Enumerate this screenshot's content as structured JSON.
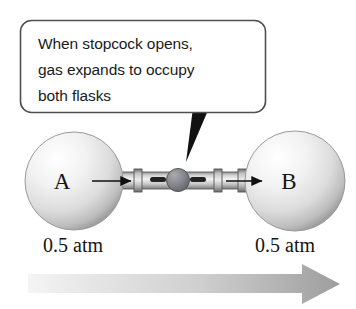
{
  "figure": {
    "background_color": "#ffffff",
    "callout": {
      "name": "stopcock-callout",
      "lines": [
        "When stopcock opens,",
        "gas expands to occupy",
        "both flasks"
      ],
      "border_color": "#4a4a4a",
      "fill_color": "#ffffff",
      "tail_color": "#111111"
    },
    "flasks": [
      {
        "id": "flask-a",
        "label": "A",
        "pressure": "0.5 atm",
        "cx": 74,
        "cy": 181,
        "r": 49,
        "fill_light": "#fdfdfd",
        "fill_dark": "#a9a9a9"
      },
      {
        "id": "flask-b",
        "label": "B",
        "pressure": "0.5 atm",
        "cx": 295,
        "cy": 181,
        "r": 50,
        "fill_light": "#fdfdfd",
        "fill_dark": "#a9a9a9"
      }
    ],
    "stopcock": {
      "name": "stopcock-valve",
      "cx": 178,
      "cy": 180,
      "r": 10,
      "color": "#7e8086"
    },
    "tube": {
      "name": "connecting-tube",
      "color_light": "#e8e8e8",
      "color_mid": "#b8b8b8",
      "color_dark": "#6f6f6f",
      "y": 180,
      "left_x": 110,
      "right_x": 248
    },
    "flow_arrows": [
      {
        "id": "flow-arrow-into-a",
        "x1": 92,
        "x2": 133,
        "y": 181
      },
      {
        "id": "flow-arrow-into-b",
        "x1": 228,
        "x2": 262,
        "y": 181
      }
    ],
    "expansion_arrow": {
      "name": "expansion-direction-arrow",
      "label": "",
      "x_start": 28,
      "x_end": 340,
      "y": 283,
      "gradient_from": "#f0f0f0",
      "gradient_to": "#9a9a9a"
    }
  }
}
